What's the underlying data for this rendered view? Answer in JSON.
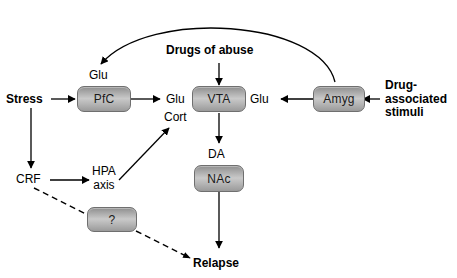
{
  "figure": {
    "background_color": "#ffffff",
    "stroke_color": "#000000",
    "node_fill_light": "#c9c9c9",
    "node_fill_dark": "#8e8e8e",
    "node_border_color": "#6f6f6f"
  },
  "nodes": {
    "pfc": {
      "label": "PfC"
    },
    "vta": {
      "label": "VTA"
    },
    "amyg": {
      "label": "Amyg"
    },
    "nac": {
      "label": "NAc"
    },
    "unknown": {
      "label": "?"
    }
  },
  "labels": {
    "stress": {
      "text": "Stress",
      "bold": true
    },
    "drugs_of_abuse": {
      "text": "Drugs of abuse",
      "bold": true
    },
    "relapse": {
      "text": "Relapse",
      "bold": true
    },
    "drug_associated_stimuli": {
      "line1": "Drug-",
      "line2": "associated",
      "line3": "stimuli",
      "bold": true
    },
    "glu_pfc_top": {
      "text": "Glu"
    },
    "glu_pfc_to_vta": {
      "text": "Glu"
    },
    "glu_amyg_to_vta": {
      "text": "Glu"
    },
    "cort": {
      "text": "Cort"
    },
    "da": {
      "text": "DA"
    },
    "crf": {
      "text": "CRF"
    },
    "hpa_axis": {
      "line1": "HPA",
      "line2": "axis"
    }
  },
  "edges": [
    {
      "name": "stress-to-pfc",
      "from": "Stress",
      "to": "PfC",
      "style": "solid",
      "arrow": true
    },
    {
      "name": "stress-to-crf",
      "from": "Stress",
      "to": "CRF",
      "style": "solid",
      "arrow": true
    },
    {
      "name": "crf-to-hpa-axis",
      "from": "CRF",
      "to": "HPA axis",
      "style": "solid",
      "arrow": true
    },
    {
      "name": "hpa-axis-to-cort",
      "from": "HPA axis",
      "to": "Cort",
      "style": "solid",
      "arrow": true
    },
    {
      "name": "pfc-to-vta",
      "from": "PfC",
      "to": "VTA",
      "label": "Glu",
      "style": "solid",
      "arrow": true
    },
    {
      "name": "drugs-of-abuse-to-vta",
      "from": "Drugs of abuse",
      "to": "VTA",
      "style": "solid",
      "arrow": true
    },
    {
      "name": "amyg-to-vta",
      "from": "Amyg",
      "to": "VTA",
      "label": "Glu",
      "style": "solid",
      "arrow": true
    },
    {
      "name": "drug-associated-stimuli-to-amyg",
      "from": "Drug-associated stimuli",
      "to": "Amyg",
      "style": "solid",
      "arrow": true
    },
    {
      "name": "amyg-to-pfc-arc",
      "from": "Amyg",
      "to": "PfC",
      "label": "Glu",
      "style": "solid-curved",
      "arrow": true
    },
    {
      "name": "vta-to-nac",
      "from": "VTA",
      "to": "NAc",
      "label": "DA",
      "style": "solid",
      "arrow": true
    },
    {
      "name": "nac-to-relapse",
      "from": "NAc",
      "to": "Relapse",
      "style": "solid",
      "arrow": true
    },
    {
      "name": "crf-to-unknown-to-relapse",
      "from": "CRF",
      "to": "Relapse",
      "via": "?",
      "style": "dashed",
      "arrow": true
    }
  ]
}
